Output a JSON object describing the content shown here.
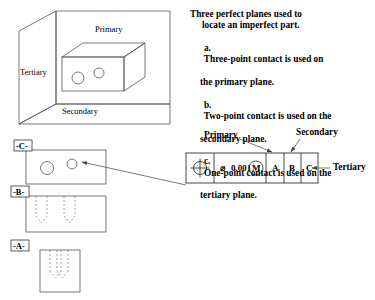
{
  "drawing": {
    "title": "Three perfect planes datum reference frame illustration",
    "line_color": "#444444",
    "hidden_line_color": "#8a8a8a",
    "text_color": "#000000",
    "background": "#ffffff"
  },
  "isometric": {
    "name": "datum-reference-frame-isometric",
    "labels": {
      "primary": "Primary",
      "secondary": "Secondary",
      "tertiary": "Tertiary"
    },
    "part": {
      "holes": 2,
      "description": "imperfect part block with two holes"
    }
  },
  "note": {
    "heading_line_1": "Three perfect planes used to",
    "heading_line_2": "locate an imperfect part.",
    "items": [
      {
        "marker": "a.",
        "line_1": "Three-point contact is used on",
        "line_2": "the primary plane."
      },
      {
        "marker": "b.",
        "line_1": "Two-point contact is used on the",
        "line_2": "secondary plane."
      },
      {
        "marker": "c.",
        "line_1": "One-point contact is used on the",
        "line_2": "tertiary plane."
      }
    ]
  },
  "views": {
    "top": {
      "name": "top-view",
      "datum_label": "-C-",
      "hole_count": 2
    },
    "front": {
      "name": "front-view",
      "datum_label": "-B-",
      "hole_count": 2
    },
    "side": {
      "name": "side-view",
      "datum_label": "-A-",
      "hole_count": 2
    }
  },
  "feature_control_frame": {
    "name": "feature-control-frame",
    "cells": [
      {
        "id": "geometric-characteristic",
        "type": "symbol",
        "symbol": "position-symbol",
        "text": ""
      },
      {
        "id": "tolerance",
        "type": "text",
        "text": "0.001",
        "diameter_symbol": "⌀",
        "material_modifier": "M"
      },
      {
        "id": "primary-datum",
        "type": "text",
        "text": "A"
      },
      {
        "id": "secondary-datum",
        "type": "text",
        "text": "B"
      },
      {
        "id": "tertiary-datum",
        "type": "text",
        "text": "C"
      }
    ],
    "callouts": {
      "primary": "Primary",
      "secondary": "Secondary",
      "tertiary": "Tertiary"
    }
  }
}
